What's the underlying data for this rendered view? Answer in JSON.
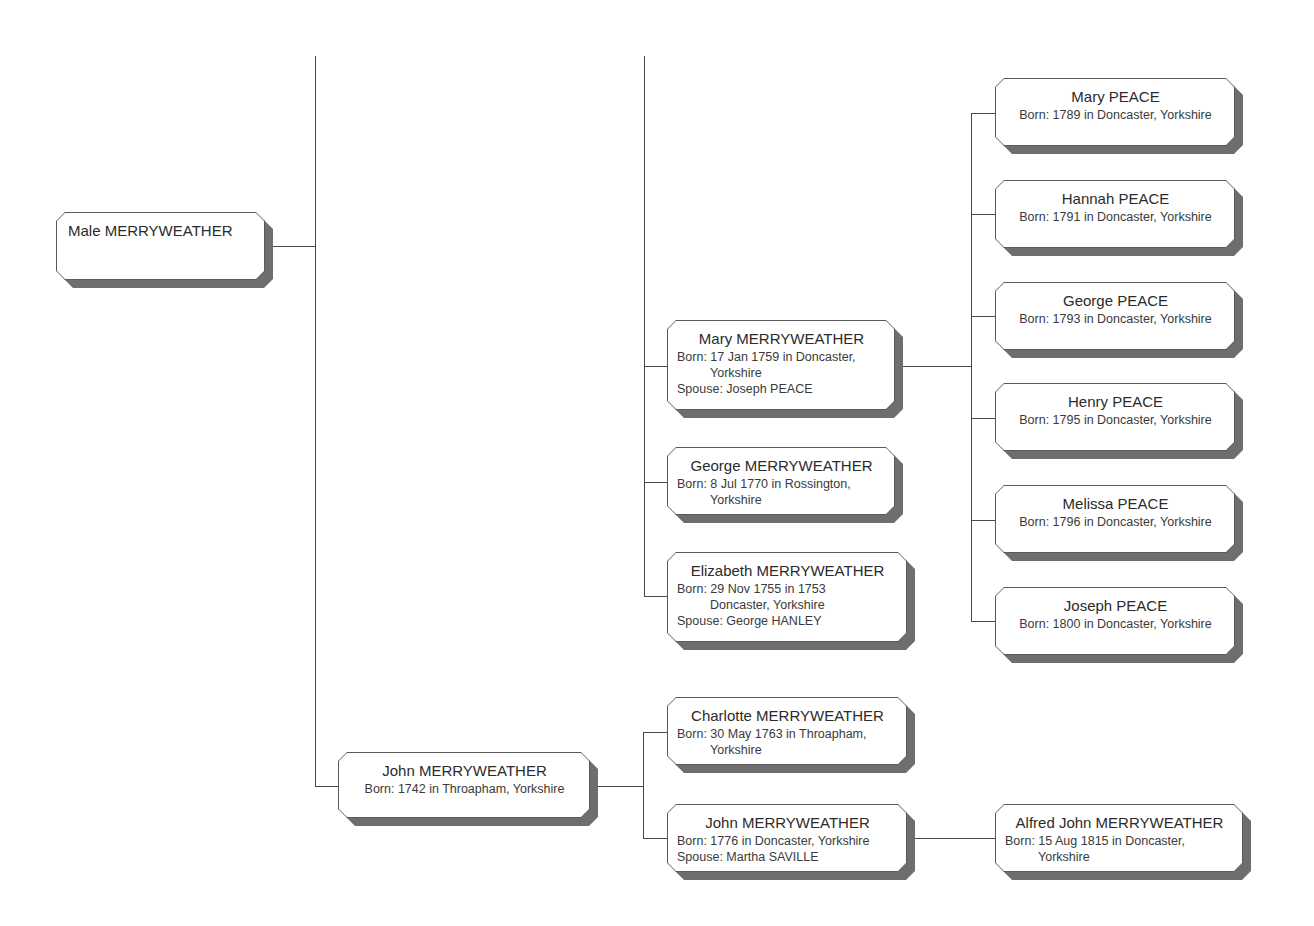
{
  "diagram": {
    "type": "family-tree-descendant-chart",
    "nodes": {
      "male_merryweather": {
        "name": "Male MERRYWEATHER"
      },
      "john_1742": {
        "name": "John MERRYWEATHER",
        "born": "Born: 1742 in Throapham, Yorkshire"
      },
      "mary_m": {
        "name": "Mary MERRYWEATHER",
        "born": "Born: 17 Jan 1759 in Doncaster,",
        "born_cont": "Yorkshire",
        "spouse": "Spouse: Joseph PEACE"
      },
      "george_m": {
        "name": "George MERRYWEATHER",
        "born": "Born: 8 Jul 1770 in Rossington,",
        "born_cont": "Yorkshire"
      },
      "elizabeth_m": {
        "name": "Elizabeth MERRYWEATHER",
        "born": "Born: 29 Nov 1755 in 1753",
        "born_cont": "Doncaster, Yorkshire",
        "spouse": "Spouse: George HANLEY"
      },
      "charlotte_m": {
        "name": "Charlotte MERRYWEATHER",
        "born": "Born: 30 May 1763 in Throapham,",
        "born_cont": "Yorkshire"
      },
      "john_1776": {
        "name": "John MERRYWEATHER",
        "born": "Born: 1776 in Doncaster, Yorkshire",
        "spouse": "Spouse: Martha SAVILLE"
      },
      "alfred_john": {
        "name": "Alfred John MERRYWEATHER",
        "born": "Born: 15 Aug 1815 in Doncaster,",
        "born_cont": "Yorkshire"
      },
      "mary_peace": {
        "name": "Mary PEACE",
        "born": "Born: 1789 in Doncaster, Yorkshire"
      },
      "hannah_peace": {
        "name": "Hannah PEACE",
        "born": "Born: 1791 in Doncaster, Yorkshire"
      },
      "george_peace": {
        "name": "George PEACE",
        "born": "Born: 1793 in Doncaster, Yorkshire"
      },
      "henry_peace": {
        "name": "Henry PEACE",
        "born": "Born: 1795 in Doncaster, Yorkshire"
      },
      "melissa_peace": {
        "name": "Melissa PEACE",
        "born": "Born: 1796 in Doncaster, Yorkshire"
      },
      "joseph_peace": {
        "name": "Joseph PEACE",
        "born": "Born: 1800 in Doncaster, Yorkshire"
      }
    },
    "edges": [
      [
        "male_merryweather",
        "john_1742"
      ],
      [
        "john_1742",
        "charlotte_m"
      ],
      [
        "john_1742",
        "john_1776"
      ],
      [
        "john_1776",
        "alfred_john"
      ],
      [
        "mary_m",
        "mary_peace"
      ],
      [
        "mary_m",
        "hannah_peace"
      ],
      [
        "mary_m",
        "george_peace"
      ],
      [
        "mary_m",
        "henry_peace"
      ],
      [
        "mary_m",
        "melissa_peace"
      ],
      [
        "mary_m",
        "joseph_peace"
      ]
    ],
    "colors": {
      "line": "#4a4a4a",
      "box_border": "#5a5a5a",
      "shadow": "#6e6e6e",
      "box_fill": "#ffffff",
      "text": "#2b2b2b"
    }
  }
}
